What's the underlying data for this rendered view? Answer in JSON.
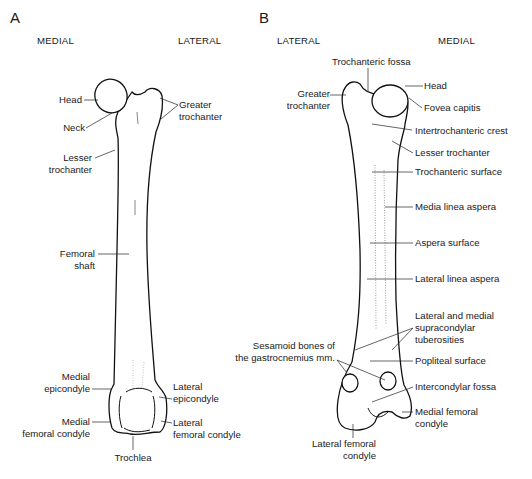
{
  "panels": [
    {
      "letter": "A",
      "left_side": "MEDIAL",
      "right_side": "LATERAL",
      "labels": {
        "head": "Head",
        "neck": "Neck",
        "greater_trochanter_1": "Greater",
        "greater_trochanter_2": "trochanter",
        "lesser_trochanter_1": "Lesser",
        "lesser_trochanter_2": "trochanter",
        "femoral_shaft_1": "Femoral",
        "femoral_shaft_2": "shaft",
        "medial_epicondyle_1": "Medial",
        "medial_epicondyle_2": "epicondyle",
        "lateral_epicondyle_1": "Lateral",
        "lateral_epicondyle_2": "epicondyle",
        "medial_femoral_condyle_1": "Medial",
        "medial_femoral_condyle_2": "femoral condyle",
        "lateral_femoral_condyle_1": "Lateral",
        "lateral_femoral_condyle_2": "femoral condyle",
        "trochlea": "Trochlea"
      }
    },
    {
      "letter": "B",
      "left_side": "LATERAL",
      "right_side": "MEDIAL",
      "labels": {
        "trochanteric_fossa": "Trochanteric fossa",
        "greater_trochanter_1": "Greater",
        "greater_trochanter_2": "trochanter",
        "head": "Head",
        "fovea_capitis": "Fovea capitis",
        "intertrochanteric_crest": "Intertrochanteric crest",
        "lesser_trochanter": "Lesser trochanter",
        "trochanteric_surface": "Trochanteric surface",
        "media_linea_aspera": "Media linea aspera",
        "aspera_surface": "Aspera surface",
        "lateral_linea_aspera": "Lateral linea aspera",
        "supracondylar_1": "Lateral and medial",
        "supracondylar_2": "supracondylar",
        "supracondylar_3": "tuberosities",
        "sesamoid_1": "Sesamoid bones of",
        "sesamoid_2": "the gastrocnemius mm.",
        "popliteal_surface": "Popliteal surface",
        "intercondylar_fossa": "Intercondylar fossa",
        "medial_femoral_condyle_1": "Medial femoral",
        "medial_femoral_condyle_2": "condyle",
        "lateral_femoral_condyle_1": "Lateral femoral",
        "lateral_femoral_condyle_2": "condyle"
      }
    }
  ]
}
